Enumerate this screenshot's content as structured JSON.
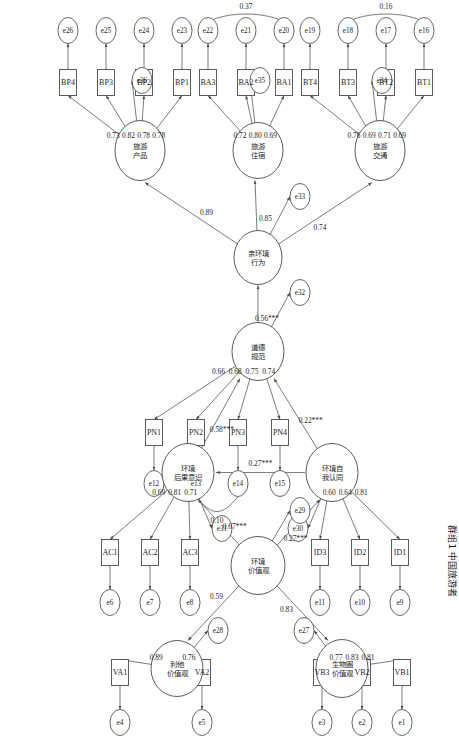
{
  "figure": {
    "caption": "群组1  中国旅游者",
    "type": "sem-path-diagram",
    "orientation": "rotated-90-clockwise"
  },
  "latents": [
    {
      "id": "L_BT",
      "label": "旅游\n交通",
      "line1": "旅游",
      "line2": "交通",
      "x": 150,
      "y": 70,
      "rx": 30,
      "ry": 25
    },
    {
      "id": "L_BA",
      "label": "旅游\n住宿",
      "line1": "旅游",
      "line2": "住宿",
      "x": 150,
      "y": 192,
      "rx": 28,
      "ry": 25
    },
    {
      "id": "L_BP",
      "label": "旅游\n产品",
      "line1": "旅游",
      "line2": "产品",
      "x": 150,
      "y": 310,
      "rx": 30,
      "ry": 25
    },
    {
      "id": "L_PEB",
      "label": "亲环境\n行为",
      "line1": "亲环境",
      "line2": "行为",
      "x": 257,
      "y": 192,
      "rx": 27,
      "ry": 24
    },
    {
      "id": "L_PN",
      "label": "道德\n规范",
      "line1": "道德",
      "line2": "规范",
      "x": 351,
      "y": 192,
      "rx": 29,
      "ry": 26
    },
    {
      "id": "L_ID",
      "label": "环境自\n我认同",
      "line1": "环境自",
      "line2": "我认同",
      "x": 472,
      "y": 118,
      "rx": 29,
      "ry": 26
    },
    {
      "id": "L_AC",
      "label": "环境\n后果意识",
      "line1": "环境",
      "line2": "后果意识",
      "x": 472,
      "y": 262,
      "rx": 29,
      "ry": 26
    },
    {
      "id": "L_EV",
      "label": "环境\n价值观",
      "line1": "环境",
      "line2": "价值观",
      "x": 565,
      "y": 192,
      "rx": 29,
      "ry": 27
    },
    {
      "id": "L_VB",
      "label": "生物圈\n价值观",
      "line1": "生物圈",
      "line2": "价值观",
      "x": 668,
      "y": 108,
      "rx": 29,
      "ry": 26
    },
    {
      "id": "L_VA",
      "label": "利他\n价值观",
      "line1": "利他",
      "line2": "价值观",
      "x": 668,
      "y": 273,
      "rx": 28,
      "ry": 26
    }
  ],
  "observed": [
    {
      "id": "BT1",
      "label": "BT1"
    },
    {
      "id": "BT2",
      "label": "BT2"
    },
    {
      "id": "BT3",
      "label": "BT3"
    },
    {
      "id": "BT4",
      "label": "BT4"
    },
    {
      "id": "BA1",
      "label": "BA1"
    },
    {
      "id": "BA2",
      "label": "BA2"
    },
    {
      "id": "BA3",
      "label": "BA3"
    },
    {
      "id": "BP1",
      "label": "BP1"
    },
    {
      "id": "BP2",
      "label": "BP2"
    },
    {
      "id": "BP3",
      "label": "BP3"
    },
    {
      "id": "BP4",
      "label": "BP4"
    },
    {
      "id": "PN1",
      "label": "PN1"
    },
    {
      "id": "PN2",
      "label": "PN2"
    },
    {
      "id": "PN3",
      "label": "PN3"
    },
    {
      "id": "PN4",
      "label": "PN4"
    },
    {
      "id": "ID1",
      "label": "ID1"
    },
    {
      "id": "ID2",
      "label": "ID2"
    },
    {
      "id": "ID3",
      "label": "ID3"
    },
    {
      "id": "AC1",
      "label": "AC1"
    },
    {
      "id": "AC2",
      "label": "AC2"
    },
    {
      "id": "AC3",
      "label": "AC3"
    },
    {
      "id": "VB1",
      "label": "VB1"
    },
    {
      "id": "VB2",
      "label": "VB2"
    },
    {
      "id": "VB3",
      "label": "VB3"
    },
    {
      "id": "VA1",
      "label": "VA1"
    },
    {
      "id": "VA2",
      "label": "VA2"
    }
  ],
  "errors": [
    "e1",
    "e2",
    "e3",
    "e4",
    "e5",
    "e6",
    "e7",
    "e8",
    "e9",
    "e10",
    "e11",
    "e12",
    "e13",
    "e14",
    "e15",
    "e16",
    "e17",
    "e18",
    "e19",
    "e20",
    "e21",
    "e22",
    "e23",
    "e24",
    "e25",
    "e26",
    "e27",
    "e28",
    "e29",
    "e30",
    "e31",
    "e32",
    "e33",
    "e34",
    "e35",
    "e36"
  ],
  "loadings": {
    "BT1": "0.69",
    "BT2": "0.71",
    "BT3": "0.69",
    "BT4": "0.76",
    "BA1": "0.69",
    "BA2": "0.80",
    "BA3": "0.72",
    "BP1": "0.78",
    "BP2": "0.78",
    "BP3": "0.82",
    "BP4": "0.73",
    "PN1": "0.66",
    "PN2": "0.68",
    "PN3": "0.75",
    "PN4": "0.74",
    "ID1": "0.81",
    "ID2": "0.64",
    "ID3": "0.60",
    "AC1": "0.69",
    "AC2": "0.81",
    "AC3": "0.71",
    "VB1": "0.81",
    "VB2": "0.83",
    "VB3": "0.77",
    "VA1": "0.89",
    "VA2": "0.76"
  },
  "structural_paths": [
    {
      "from": "L_PEB",
      "to": "L_BT",
      "value": "0.74"
    },
    {
      "from": "L_PEB",
      "to": "L_BA",
      "value": "0.85"
    },
    {
      "from": "L_PEB",
      "to": "L_BP",
      "value": "0.89"
    },
    {
      "from": "L_PN",
      "to": "L_PEB",
      "value": "0.56***"
    },
    {
      "from": "L_ID",
      "to": "L_PN",
      "value": "0.22***"
    },
    {
      "from": "L_AC",
      "to": "L_PN",
      "value": "0.58***"
    },
    {
      "from": "L_ID",
      "to": "L_AC",
      "value": "0.27***"
    },
    {
      "from": "L_EV",
      "to": "L_ID",
      "value": "0.27***"
    },
    {
      "from": "L_EV",
      "to": "L_AC",
      "value": "0.67***"
    },
    {
      "from": "L_EV",
      "to": "L_VB",
      "value": "0.83"
    },
    {
      "from": "L_EV",
      "to": "L_VA",
      "value": "0.59"
    }
  ],
  "covariances": [
    {
      "between": [
        "e16",
        "e18"
      ],
      "value": "0.16"
    },
    {
      "between": [
        "e20",
        "e22"
      ],
      "value": "0.37"
    },
    {
      "between": [
        "e13",
        "e14"
      ],
      "value": "0.10"
    }
  ]
}
